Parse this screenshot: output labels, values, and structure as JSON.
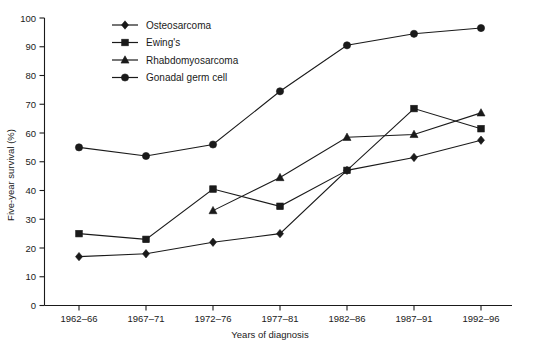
{
  "chart_data": {
    "type": "line",
    "title": "",
    "xlabel": "Years of diagnosis",
    "ylabel": "Five-year survival (%)",
    "categories": [
      "1962–66",
      "1967–71",
      "1972–76",
      "1977–81",
      "1982–86",
      "1987–91",
      "1992–96"
    ],
    "ylim": [
      0,
      100
    ],
    "yticks": [
      0,
      10,
      20,
      30,
      40,
      50,
      60,
      70,
      80,
      90,
      100
    ],
    "grid": false,
    "legend_position": "top-left-inside",
    "series": [
      {
        "name": "Osteosarcoma",
        "marker": "diamond",
        "color": "#1a1a1a",
        "values": [
          17,
          18,
          22,
          25,
          47,
          51.5,
          57.5
        ]
      },
      {
        "name": "Ewing's",
        "marker": "square",
        "color": "#1a1a1a",
        "values": [
          25,
          23,
          40.5,
          34.5,
          47,
          68.5,
          61.5
        ]
      },
      {
        "name": "Rhabdomyosarcoma",
        "marker": "triangle",
        "color": "#1a1a1a",
        "values": [
          null,
          null,
          33,
          44.5,
          58.5,
          59.5,
          67
        ]
      },
      {
        "name": "Gonadal germ cell",
        "marker": "circle",
        "color": "#1a1a1a",
        "values": [
          55,
          52,
          56,
          74.5,
          90.5,
          94.5,
          96.5
        ]
      }
    ]
  },
  "axis": {
    "y_tick_labels": [
      "0",
      "10",
      "20",
      "30",
      "40",
      "50",
      "60",
      "70",
      "80",
      "90",
      "100"
    ],
    "x_tick_labels": [
      "1962–66",
      "1967–71",
      "1972–76",
      "1977–81",
      "1982–86",
      "1987–91",
      "1992–96"
    ],
    "y_title": "Five-year survival (%)",
    "x_title": "Years of diagnosis"
  },
  "legend": {
    "items": [
      {
        "label": "Osteosarcoma",
        "marker": "diamond-marker-icon"
      },
      {
        "label": "Ewing's",
        "marker": "square-marker-icon"
      },
      {
        "label": "Rhabdomyosarcoma",
        "marker": "triangle-marker-icon"
      },
      {
        "label": "Gonadal germ cell",
        "marker": "circle-marker-icon"
      }
    ]
  }
}
